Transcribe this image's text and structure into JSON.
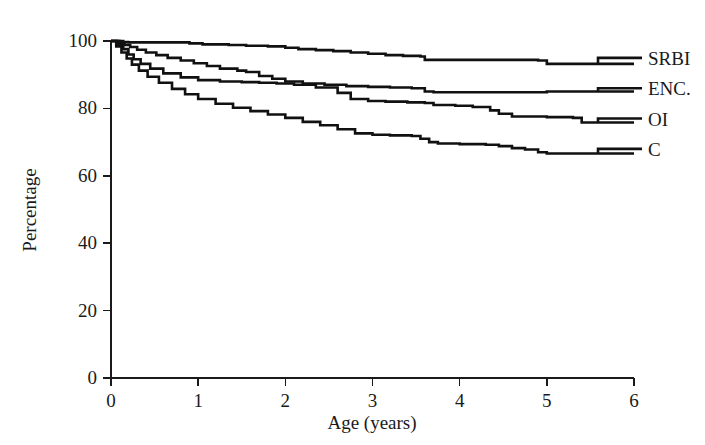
{
  "chart_data": {
    "type": "line",
    "title": "",
    "subtitle": "",
    "xlabel": "Age (years)",
    "ylabel": "Percentage",
    "xlim": [
      0,
      6
    ],
    "ylim": [
      0,
      100
    ],
    "xticks": [
      0,
      1,
      2,
      3,
      4,
      5,
      6
    ],
    "yticks": [
      0,
      20,
      40,
      60,
      80,
      100
    ],
    "xtick_labels": [
      "0",
      "1",
      "2",
      "3",
      "4",
      "5",
      "6"
    ],
    "ytick_labels": [
      "0",
      "20",
      "40",
      "60",
      "80",
      "100"
    ],
    "grid": false,
    "legend_position": "right-of-axes-inline",
    "step_style": "post",
    "series": [
      {
        "name": "SRBI",
        "label": "SRBI",
        "color": "#111111",
        "label_y": 95,
        "x": [
          0.0,
          0.08,
          0.14,
          0.2,
          0.75,
          0.9,
          1.05,
          1.35,
          1.55,
          1.8,
          2.0,
          2.15,
          2.35,
          2.55,
          2.75,
          2.95,
          3.15,
          3.35,
          3.55,
          3.6,
          4.3,
          4.9,
          5.0,
          5.95
        ],
        "y": [
          100.0,
          100.0,
          99.7,
          99.6,
          99.6,
          99.3,
          99.0,
          98.8,
          98.6,
          98.4,
          98.0,
          97.6,
          97.3,
          97.0,
          96.6,
          96.2,
          95.8,
          95.6,
          95.4,
          94.4,
          94.4,
          94.2,
          93.2,
          93.2
        ]
      },
      {
        "name": "ENC.",
        "label": "ENC.",
        "color": "#111111",
        "label_y": 86,
        "x": [
          0.0,
          0.1,
          0.16,
          0.22,
          0.3,
          0.4,
          0.52,
          0.65,
          0.8,
          0.95,
          1.1,
          1.25,
          1.45,
          1.55,
          1.7,
          1.85,
          2.0,
          2.2,
          2.45,
          2.7,
          2.95,
          3.2,
          3.45,
          3.6,
          3.7,
          4.2,
          5.0,
          5.95
        ],
        "y": [
          100.0,
          99.6,
          98.8,
          98.2,
          97.4,
          96.6,
          95.8,
          95.0,
          94.2,
          93.4,
          92.6,
          91.8,
          91.2,
          90.8,
          89.6,
          88.8,
          88.0,
          87.4,
          87.0,
          86.6,
          86.4,
          86.2,
          86.0,
          85.0,
          84.8,
          84.8,
          85.0,
          85.0
        ]
      },
      {
        "name": "OI",
        "label": "OI",
        "color": "#111111",
        "label_y": 77,
        "x": [
          0.0,
          0.08,
          0.14,
          0.2,
          0.26,
          0.34,
          0.45,
          0.6,
          0.8,
          1.0,
          1.25,
          1.5,
          1.7,
          1.9,
          2.1,
          2.35,
          2.6,
          2.75,
          2.95,
          3.15,
          3.4,
          3.6,
          3.7,
          3.95,
          4.15,
          4.35,
          4.45,
          4.6,
          5.0,
          5.3,
          5.4,
          5.95
        ],
        "y": [
          100.0,
          99.0,
          97.6,
          96.0,
          94.6,
          93.2,
          91.8,
          90.4,
          89.2,
          88.4,
          88.0,
          87.8,
          87.6,
          87.4,
          87.0,
          86.2,
          84.6,
          82.8,
          82.2,
          82.0,
          81.8,
          81.6,
          81.0,
          80.8,
          80.4,
          79.4,
          78.4,
          77.6,
          77.4,
          77.2,
          75.8,
          75.8
        ]
      },
      {
        "name": "C",
        "label": "C",
        "color": "#111111",
        "label_y": 68,
        "x": [
          0.0,
          0.06,
          0.12,
          0.18,
          0.24,
          0.32,
          0.42,
          0.55,
          0.7,
          0.85,
          1.0,
          1.2,
          1.4,
          1.6,
          1.8,
          2.0,
          2.2,
          2.4,
          2.6,
          2.8,
          3.0,
          3.2,
          3.45,
          3.55,
          3.65,
          3.75,
          4.0,
          4.3,
          4.45,
          4.6,
          4.75,
          4.9,
          5.0,
          5.95
        ],
        "y": [
          100.0,
          98.4,
          96.6,
          94.8,
          93.0,
          91.2,
          89.4,
          87.6,
          85.8,
          84.2,
          82.8,
          81.4,
          80.2,
          79.2,
          78.2,
          77.2,
          76.0,
          75.0,
          73.8,
          72.6,
          72.2,
          72.0,
          71.8,
          71.0,
          70.0,
          69.6,
          69.4,
          69.2,
          68.8,
          68.2,
          67.8,
          67.0,
          66.6,
          66.6
        ]
      }
    ]
  },
  "axes": {
    "x_axis_label": "Age (years)",
    "y_axis_label": "Percentage"
  },
  "legend": {
    "items": [
      {
        "label": "SRBI"
      },
      {
        "label": "ENC."
      },
      {
        "label": "OI"
      },
      {
        "label": "C"
      }
    ]
  },
  "colors": {
    "line": "#111111",
    "axis": "#1a1a1a",
    "background": "#ffffff"
  }
}
